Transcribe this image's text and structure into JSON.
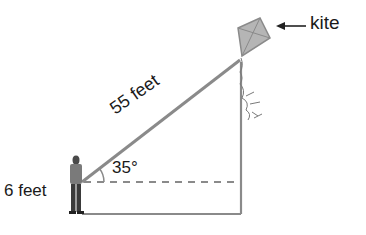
{
  "diagram": {
    "type": "right-triangle word problem",
    "labels": {
      "kite": "kite",
      "hypotenuse": "55 feet",
      "angle": "35°",
      "height": "6 feet"
    },
    "colors": {
      "line": "#8a8a8a",
      "text": "#1a1a1a",
      "kite_fill": "#b5b5b5",
      "figure": "#4a4a4a"
    },
    "elements": [
      "kite",
      "kite-string (hypotenuse)",
      "vertical line from kite to ground",
      "dashed horizontal line at eye level",
      "ground line",
      "person holding string",
      "angle arc"
    ]
  }
}
